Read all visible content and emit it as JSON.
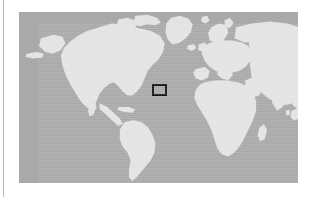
{
  "figure": {
    "type": "locator-map",
    "title": "World map locator",
    "projection": "equirectangular",
    "map_area_px": {
      "x": 19,
      "y": 12,
      "width": 279,
      "height": 171
    },
    "colors": {
      "ocean": "#a9a9a9",
      "land": "#e3e3e3",
      "highlight_box_stroke": "#161616",
      "page_background": "#ffffff",
      "gutter_rule": "#b9b9b9"
    },
    "highlight_region": {
      "label": "study-area",
      "box_px": {
        "x": 152,
        "y": 84,
        "width": 15,
        "height": 12
      },
      "stroke_width_px": 2,
      "approx_location": "Iberian Peninsula / Western Mediterranean",
      "lon_range_deg": [
        -13,
        7
      ],
      "lat_range_deg": [
        31,
        45
      ]
    },
    "continents_visible": [
      "North America",
      "Greenland",
      "South America",
      "Europe",
      "Africa",
      "Asia",
      "Australia",
      "Indonesia"
    ],
    "labels": [],
    "axis_ticks": [],
    "legend": []
  },
  "gutter": {
    "rule_x_px": 3,
    "visible": true
  }
}
